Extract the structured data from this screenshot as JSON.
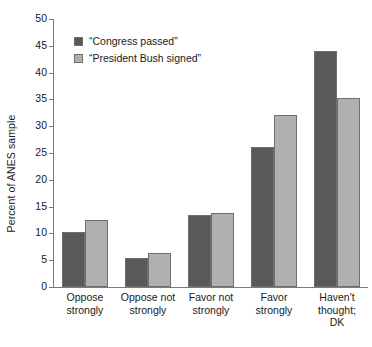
{
  "chart_data": {
    "type": "bar",
    "title": "",
    "xlabel": "",
    "ylabel": "Percent of ANES sample",
    "ylim": [
      0,
      50
    ],
    "ytick_step": 5,
    "yticks": [
      "50",
      "45",
      "40",
      "35",
      "30",
      "25",
      "20",
      "15",
      "10",
      "5",
      "0"
    ],
    "grid": false,
    "legend_position": "top-left inside plot",
    "categories": [
      "Oppose strongly",
      "Oppose not strongly",
      "Favor not strongly",
      "Favor strongly",
      "Haven't thought; DK"
    ],
    "category_lines": [
      [
        "Oppose",
        "strongly"
      ],
      [
        "Oppose not",
        "strongly"
      ],
      [
        "Favor not",
        "strongly"
      ],
      [
        "Favor",
        "strongly"
      ],
      [
        "Haven't",
        "thought;",
        "DK"
      ]
    ],
    "series": [
      {
        "name": "“Congress passed”",
        "color": "#595959",
        "values": [
          10.3,
          5.4,
          13.5,
          26.1,
          44.0
        ]
      },
      {
        "name": "“President Bush signed”",
        "color": "#b0b0b0",
        "values": [
          12.5,
          6.3,
          13.8,
          32.1,
          35.3
        ]
      }
    ]
  },
  "axis": {
    "y_title": "Percent of ANES sample"
  },
  "legend": {
    "items": [
      {
        "label": "“Congress passed”",
        "color": "#595959"
      },
      {
        "label": "“President Bush signed”",
        "color": "#b0b0b0"
      }
    ]
  },
  "colors": {
    "series_dark": "#595959",
    "series_light": "#b0b0b0",
    "axis": "#7a7a7a",
    "text": "#1a1a1a",
    "background": "#ffffff",
    "bar_border": "#6e6e6e"
  }
}
